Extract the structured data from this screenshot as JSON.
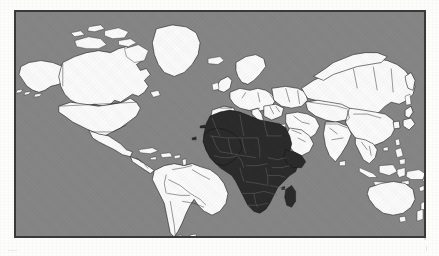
{
  "figure": {
    "kind": "world-map",
    "projection": "equirectangular",
    "title": "",
    "caption": "",
    "frame": {
      "x": 14,
      "y": 10,
      "width": 412,
      "height": 228,
      "border_color": "#3a3a3a"
    }
  },
  "colors": {
    "page_background": "#fdfdfc",
    "ocean": "#878787",
    "land_default": "#fdfdfd",
    "land_highlighted": "#2b2b2b",
    "border_line": "#1f1f1f",
    "coastline": "#1f1f1f",
    "frame": "#3a3a3a"
  },
  "legend": {
    "visible": false,
    "entries": [
      {
        "label": "Highlighted region",
        "color": "#2b2b2b"
      },
      {
        "label": "Other land",
        "color": "#fdfdfd"
      },
      {
        "label": "Ocean",
        "color": "#878787"
      }
    ]
  },
  "highlight": {
    "region_name": "Africa",
    "fill": "#2b2b2b",
    "includes_islands": true,
    "island_names": [
      "Madagascar"
    ]
  },
  "regions": [
    {
      "name": "Alaska",
      "continent": "North America",
      "highlighted": false
    },
    {
      "name": "Canada",
      "continent": "North America",
      "highlighted": false
    },
    {
      "name": "United States",
      "continent": "North America",
      "highlighted": false
    },
    {
      "name": "Mexico",
      "continent": "North America",
      "highlighted": false
    },
    {
      "name": "Greenland",
      "continent": "North America",
      "highlighted": false
    },
    {
      "name": "Central America",
      "continent": "North America",
      "highlighted": false
    },
    {
      "name": "Caribbean Islands",
      "continent": "North America",
      "highlighted": false
    },
    {
      "name": "Colombia",
      "continent": "South America",
      "highlighted": false
    },
    {
      "name": "Venezuela",
      "continent": "South America",
      "highlighted": false
    },
    {
      "name": "Brazil",
      "continent": "South America",
      "highlighted": false
    },
    {
      "name": "Peru",
      "continent": "South America",
      "highlighted": false
    },
    {
      "name": "Bolivia",
      "continent": "South America",
      "highlighted": false
    },
    {
      "name": "Chile",
      "continent": "South America",
      "highlighted": false
    },
    {
      "name": "Argentina",
      "continent": "South America",
      "highlighted": false
    },
    {
      "name": "Iceland",
      "continent": "Europe",
      "highlighted": false
    },
    {
      "name": "United Kingdom",
      "continent": "Europe",
      "highlighted": false
    },
    {
      "name": "Ireland",
      "continent": "Europe",
      "highlighted": false
    },
    {
      "name": "Scandinavia",
      "continent": "Europe",
      "highlighted": false
    },
    {
      "name": "Spain",
      "continent": "Europe",
      "highlighted": false
    },
    {
      "name": "France",
      "continent": "Europe",
      "highlighted": false
    },
    {
      "name": "Germany",
      "continent": "Europe",
      "highlighted": false
    },
    {
      "name": "Italy",
      "continent": "Europe",
      "highlighted": false
    },
    {
      "name": "Eastern Europe",
      "continent": "Europe",
      "highlighted": false
    },
    {
      "name": "Turkey",
      "continent": "Asia",
      "highlighted": false
    },
    {
      "name": "Russia",
      "continent": "Asia",
      "highlighted": false
    },
    {
      "name": "Kazakhstan",
      "continent": "Asia",
      "highlighted": false
    },
    {
      "name": "Mongolia",
      "continent": "Asia",
      "highlighted": false
    },
    {
      "name": "China",
      "continent": "Asia",
      "highlighted": false
    },
    {
      "name": "India",
      "continent": "Asia",
      "highlighted": false
    },
    {
      "name": "Arabian Peninsula",
      "continent": "Asia",
      "highlighted": false
    },
    {
      "name": "Iran",
      "continent": "Asia",
      "highlighted": false
    },
    {
      "name": "Japan",
      "continent": "Asia",
      "highlighted": false
    },
    {
      "name": "Korea",
      "continent": "Asia",
      "highlighted": false
    },
    {
      "name": "Southeast Asia",
      "continent": "Asia",
      "highlighted": false
    },
    {
      "name": "Indonesia",
      "continent": "Asia",
      "highlighted": false
    },
    {
      "name": "Philippines",
      "continent": "Asia",
      "highlighted": false
    },
    {
      "name": "Papua New Guinea",
      "continent": "Oceania",
      "highlighted": false
    },
    {
      "name": "Australia",
      "continent": "Oceania",
      "highlighted": false
    },
    {
      "name": "Tasmania",
      "continent": "Oceania",
      "highlighted": false
    },
    {
      "name": "New Zealand",
      "continent": "Oceania",
      "highlighted": false
    },
    {
      "name": "Morocco",
      "continent": "Africa",
      "highlighted": true
    },
    {
      "name": "Algeria",
      "continent": "Africa",
      "highlighted": true
    },
    {
      "name": "Tunisia",
      "continent": "Africa",
      "highlighted": true
    },
    {
      "name": "Libya",
      "continent": "Africa",
      "highlighted": true
    },
    {
      "name": "Egypt",
      "continent": "Africa",
      "highlighted": true
    },
    {
      "name": "Western Sahara",
      "continent": "Africa",
      "highlighted": true
    },
    {
      "name": "Mauritania",
      "continent": "Africa",
      "highlighted": true
    },
    {
      "name": "Mali",
      "continent": "Africa",
      "highlighted": true
    },
    {
      "name": "Niger",
      "continent": "Africa",
      "highlighted": true
    },
    {
      "name": "Chad",
      "continent": "Africa",
      "highlighted": true
    },
    {
      "name": "Sudan",
      "continent": "Africa",
      "highlighted": true
    },
    {
      "name": "Senegal",
      "continent": "Africa",
      "highlighted": true
    },
    {
      "name": "Guinea",
      "continent": "Africa",
      "highlighted": true
    },
    {
      "name": "Ivory Coast",
      "continent": "Africa",
      "highlighted": true
    },
    {
      "name": "Ghana",
      "continent": "Africa",
      "highlighted": true
    },
    {
      "name": "Nigeria",
      "continent": "Africa",
      "highlighted": true
    },
    {
      "name": "Cameroon",
      "continent": "Africa",
      "highlighted": true
    },
    {
      "name": "Central African Republic",
      "continent": "Africa",
      "highlighted": true
    },
    {
      "name": "Ethiopia",
      "continent": "Africa",
      "highlighted": true
    },
    {
      "name": "Somalia",
      "continent": "Africa",
      "highlighted": true
    },
    {
      "name": "Kenya",
      "continent": "Africa",
      "highlighted": true
    },
    {
      "name": "Uganda",
      "continent": "Africa",
      "highlighted": true
    },
    {
      "name": "Democratic Republic of the Congo",
      "continent": "Africa",
      "highlighted": true
    },
    {
      "name": "Gabon",
      "continent": "Africa",
      "highlighted": true
    },
    {
      "name": "Angola",
      "continent": "Africa",
      "highlighted": true
    },
    {
      "name": "Zambia",
      "continent": "Africa",
      "highlighted": true
    },
    {
      "name": "Tanzania",
      "continent": "Africa",
      "highlighted": true
    },
    {
      "name": "Mozambique",
      "continent": "Africa",
      "highlighted": true
    },
    {
      "name": "Zimbabwe",
      "continent": "Africa",
      "highlighted": true
    },
    {
      "name": "Botswana",
      "continent": "Africa",
      "highlighted": true
    },
    {
      "name": "Namibia",
      "continent": "Africa",
      "highlighted": true
    },
    {
      "name": "South Africa",
      "continent": "Africa",
      "highlighted": true
    },
    {
      "name": "Madagascar",
      "continent": "Africa",
      "highlighted": true
    }
  ]
}
